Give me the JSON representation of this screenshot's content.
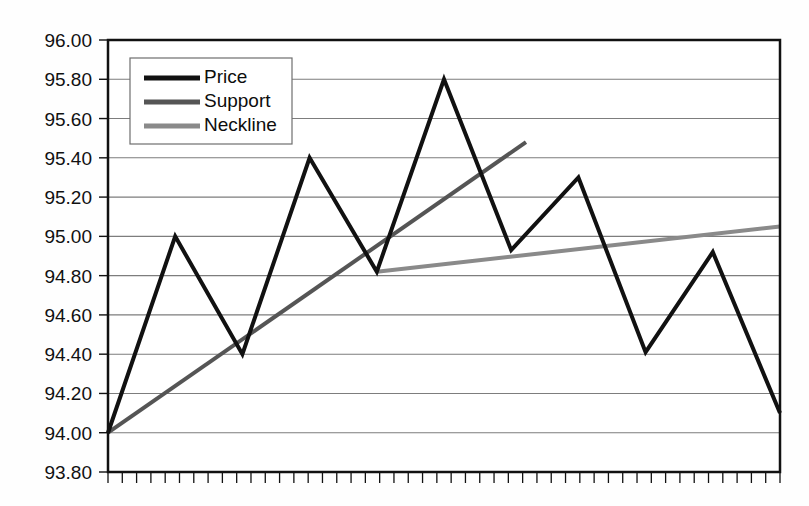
{
  "figure": {
    "background_color": "#fefefe",
    "caption": ""
  },
  "chart_data": {
    "type": "line",
    "title": "",
    "xlabel": "",
    "ylabel": "",
    "ylim": [
      93.8,
      96.0
    ],
    "ytick_step": 0.2,
    "ytick_labels": [
      "96.00",
      "95.80",
      "95.60",
      "95.40",
      "95.20",
      "95.00",
      "94.80",
      "94.60",
      "94.40",
      "94.20",
      "94.00",
      "93.80"
    ],
    "ytick_values": [
      96.0,
      95.8,
      95.6,
      95.4,
      95.2,
      95.0,
      94.8,
      94.6,
      94.4,
      94.2,
      94.0,
      93.8
    ],
    "xlim": [
      0,
      10
    ],
    "xtick_labels": [],
    "x_minor_tick_count": 47,
    "grid": "horizontal",
    "legend_position": "upper-left-inside",
    "series": [
      {
        "name": "Price",
        "color": "#111111",
        "width": 4.0,
        "x": [
          0,
          1,
          2,
          3,
          4,
          5,
          6,
          7,
          8,
          9,
          10
        ],
        "values": [
          94.0,
          95.0,
          94.4,
          95.4,
          94.82,
          95.8,
          94.93,
          95.3,
          94.41,
          94.92,
          94.1
        ]
      },
      {
        "name": "Support",
        "color": "#555555",
        "width": 4.0,
        "x": [
          0,
          6.22
        ],
        "values": [
          94.0,
          95.48
        ]
      },
      {
        "name": "Neckline",
        "color": "#8a8a8a",
        "width": 4.0,
        "x": [
          4.0,
          10.0
        ],
        "values": [
          94.82,
          95.05
        ]
      }
    ]
  },
  "legend": {
    "entries": [
      {
        "label": "Price",
        "color": "#111111"
      },
      {
        "label": "Support",
        "color": "#555555"
      },
      {
        "label": "Neckline",
        "color": "#8a8a8a"
      }
    ]
  },
  "axes": {
    "frame_color": "#111111",
    "grid_color": "#7d7d7d",
    "tick_color": "#111111"
  }
}
